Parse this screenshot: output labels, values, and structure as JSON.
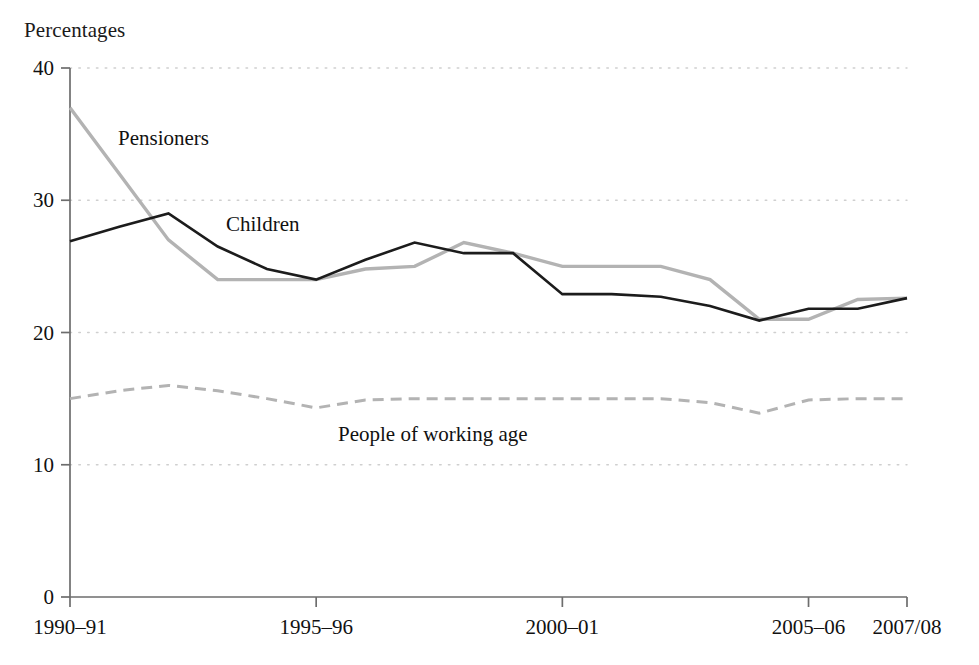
{
  "chart_data": {
    "type": "line",
    "title": "",
    "ylabel": "Percentages",
    "xlabel": "",
    "ylim": [
      0,
      40
    ],
    "yticks": [
      0,
      10,
      20,
      30,
      40
    ],
    "grid": "horizontal-dotted",
    "legend_position": "inline-labels",
    "x": [
      "1990-91",
      "1991-92",
      "1992-93",
      "1993-94",
      "1994-95",
      "1995-96",
      "1996-97",
      "1997-98",
      "1998-99",
      "1999-00",
      "2000-01",
      "2001-02",
      "2002-03",
      "2003-04",
      "2004-05",
      "2005-06",
      "2006-07",
      "2007/08"
    ],
    "xtick_labels": [
      "1990–91",
      "1995–96",
      "2000–01",
      "2005–06",
      "2007/08"
    ],
    "xtick_indices": [
      0,
      5,
      10,
      15,
      17
    ],
    "series": [
      {
        "name": "Pensioners",
        "color": "#b3b3b3",
        "style": "solid",
        "values": [
          37.0,
          32.0,
          27.0,
          24.0,
          24.0,
          24.0,
          24.8,
          25.0,
          26.8,
          26.0,
          25.0,
          25.0,
          25.0,
          24.0,
          21.0,
          21.0,
          22.5,
          22.6
        ]
      },
      {
        "name": "Children",
        "color": "#1c1c1c",
        "style": "solid",
        "values": [
          26.9,
          28.0,
          29.0,
          26.5,
          24.8,
          24.0,
          25.5,
          26.8,
          26.0,
          26.0,
          22.9,
          22.9,
          22.7,
          22.0,
          20.9,
          21.8,
          21.8,
          22.6
        ]
      },
      {
        "name": "People of working age",
        "color": "#b3b3b3",
        "style": "dashed",
        "values": [
          15.0,
          15.6,
          16.0,
          15.6,
          15.0,
          14.3,
          14.9,
          15.0,
          15.0,
          15.0,
          15.0,
          15.0,
          15.0,
          14.7,
          13.9,
          14.9,
          15.0,
          15.0
        ]
      }
    ],
    "annotations": [
      {
        "text": "Pensioners",
        "x_px": 118,
        "y_px": 145
      },
      {
        "text": "Children",
        "x_px": 226,
        "y_px": 231
      },
      {
        "text": "People of working age",
        "x_px": 338,
        "y_px": 441
      }
    ]
  }
}
